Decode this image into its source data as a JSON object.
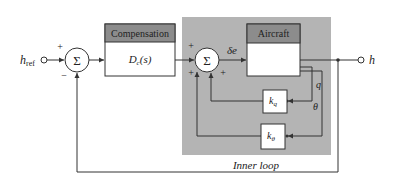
{
  "diagram": {
    "type": "block-diagram",
    "input": {
      "label_main": "h",
      "label_sub": "ref"
    },
    "output": {
      "label": "h"
    },
    "sum1": {
      "symbol": "Σ",
      "plus": "+",
      "minus": "−"
    },
    "compensation": {
      "header": "Compensation",
      "body_main": "D",
      "body_sub": "c",
      "body_arg": "(s)"
    },
    "sum2": {
      "symbol": "Σ",
      "plus_left": "+",
      "plus_bottom_left": "+",
      "plus_bottom_right": "+"
    },
    "signal_delta_e": "δe",
    "aircraft": {
      "header": "Aircraft"
    },
    "signals": {
      "q": "q",
      "theta": "θ"
    },
    "kq": {
      "main": "k",
      "sub": "q"
    },
    "ktheta": {
      "main": "k",
      "sub": "θ"
    },
    "inner_loop_label": "Inner loop",
    "colors": {
      "inner_loop_bg": "#b4b4b4",
      "header_bg": "#8c8c8c",
      "line": "#333333",
      "box_fill": "#ffffff"
    }
  }
}
